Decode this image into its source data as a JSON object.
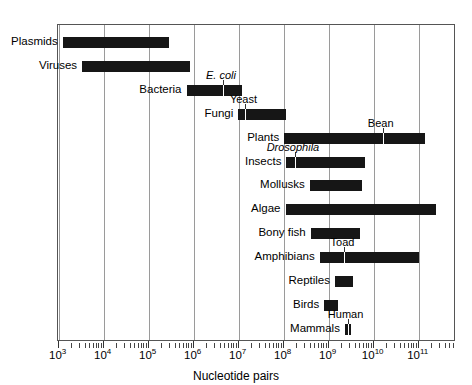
{
  "chart_data": {
    "type": "bar",
    "orientation": "horizontal",
    "title": "",
    "xlabel": "Nucleotide pairs",
    "ylabel": "",
    "xscale": "log",
    "xlim": [
      1000,
      1000000000000
    ],
    "grid": true,
    "legend": false,
    "xticks": [
      {
        "value": 1000,
        "label": "10",
        "exponent": "3"
      },
      {
        "value": 10000,
        "label": "10",
        "exponent": "4"
      },
      {
        "value": 100000,
        "label": "10",
        "exponent": "5"
      },
      {
        "value": 1000000,
        "label": "10",
        "exponent": "6"
      },
      {
        "value": 10000000,
        "label": "10",
        "exponent": "7"
      },
      {
        "value": 100000000,
        "label": "10",
        "exponent": "8"
      },
      {
        "value": 1000000000,
        "label": "10",
        "exponent": "9"
      },
      {
        "value": 10000000000,
        "label": "10",
        "exponent": "10"
      },
      {
        "value": 100000000000,
        "label": "10",
        "exponent": "11"
      }
    ],
    "categories": [
      "Plasmids",
      "Viruses",
      "Bacteria",
      "Fungi",
      "Plants",
      "Insects",
      "Mollusks",
      "Algae",
      "Bony fish",
      "Amphibians",
      "Reptiles",
      "Birds",
      "Mammals"
    ],
    "ranges": [
      {
        "category": "Plasmids",
        "log_min": 3.09,
        "log_max": 5.45
      },
      {
        "category": "Viruses",
        "log_min": 3.52,
        "log_max": 5.91
      },
      {
        "category": "Bacteria",
        "log_min": 5.84,
        "log_max": 7.08
      },
      {
        "category": "Fungi",
        "log_min": 6.99,
        "log_max": 8.06
      },
      {
        "category": "Plants",
        "log_min": 8.01,
        "log_max": 11.14
      },
      {
        "category": "Insects",
        "log_min": 8.06,
        "log_max": 9.8
      },
      {
        "category": "Mollusks",
        "log_min": 8.58,
        "log_max": 9.73
      },
      {
        "category": "Algae",
        "log_min": 8.04,
        "log_max": 11.39
      },
      {
        "category": "Bony fish",
        "log_min": 8.6,
        "log_max": 9.69
      },
      {
        "category": "Amphibians",
        "log_min": 8.8,
        "log_max": 11.0
      },
      {
        "category": "Reptiles",
        "log_min": 9.14,
        "log_max": 9.55
      },
      {
        "category": "Birds",
        "log_min": 8.9,
        "log_max": 9.21
      },
      {
        "category": "Mammals",
        "log_min": 9.36,
        "log_max": 9.49
      }
    ],
    "annotations": [
      {
        "text": "E. coli",
        "italic": true,
        "log_value": 6.65,
        "category": "Bacteria"
      },
      {
        "text": "Yeast",
        "italic": false,
        "log_value": 7.15,
        "category": "Fungi"
      },
      {
        "text": "Bean",
        "italic": false,
        "log_value": 10.2,
        "category": "Plants"
      },
      {
        "text": "Drosophila",
        "italic": true,
        "log_value": 8.25,
        "category": "Insects"
      },
      {
        "text": "Toad",
        "italic": false,
        "log_value": 9.35,
        "category": "Amphibians"
      },
      {
        "text": "Human",
        "italic": false,
        "log_value": 9.42,
        "category": "Mammals"
      }
    ]
  },
  "axis": {
    "xlabel": "Nucleotide pairs"
  },
  "colors": {
    "bar": "#161616",
    "grid": "#9a9a9a",
    "frame": "#555555",
    "text": "#000000",
    "background": "#ffffff"
  }
}
